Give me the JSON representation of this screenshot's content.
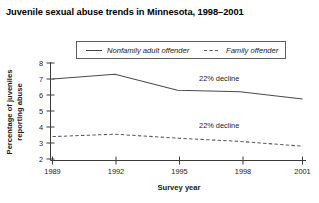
{
  "chart_data": {
    "type": "line",
    "title": "Juvenile sexual abuse trends in Minnesota, 1998–2001",
    "xlabel": "Survey year",
    "ylabel": "Percentage of juveniles reporting abuse",
    "x": [
      1989,
      1992,
      1995,
      1998,
      2001
    ],
    "xtick_labels": [
      "1989",
      "1992",
      "1995",
      "1998",
      "2001"
    ],
    "xlim": [
      1989,
      2001
    ],
    "ylim": [
      2,
      8
    ],
    "ytick_labels": [
      "2",
      "3",
      "4",
      "5",
      "6",
      "7",
      "8"
    ],
    "yticks": [
      2,
      3,
      4,
      5,
      6,
      7,
      8
    ],
    "grid": false,
    "legend_position": "top-center",
    "series": [
      {
        "name": "Nonfamily adult offender",
        "style": "solid",
        "color": "#4a4a4a",
        "values": [
          7.0,
          7.3,
          6.3,
          6.2,
          5.75
        ]
      },
      {
        "name": "Family offender",
        "style": "dashed",
        "color": "#5a5a5a",
        "values": [
          3.4,
          3.55,
          3.3,
          3.1,
          2.8
        ]
      }
    ],
    "annotations": [
      {
        "text": "22% decline",
        "x": 1997.0,
        "y": 6.85,
        "series": "Nonfamily adult offender"
      },
      {
        "text": "22% decline",
        "x": 1997.0,
        "y": 3.95,
        "series": "Family offender"
      }
    ]
  }
}
